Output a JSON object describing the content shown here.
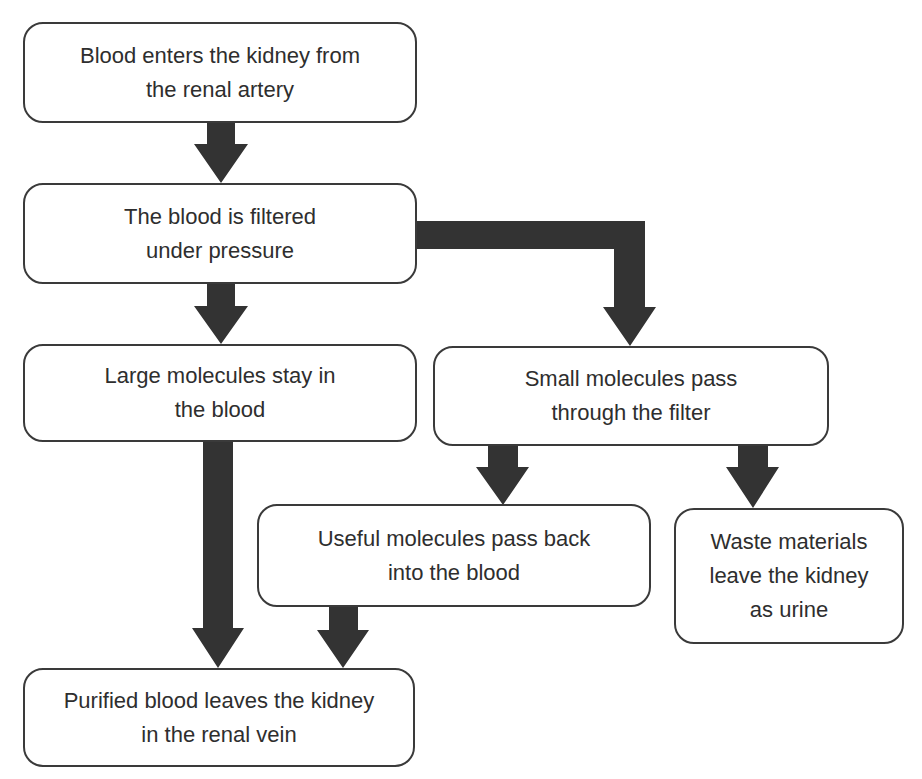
{
  "diagram": {
    "type": "flowchart",
    "arrow_color": "#333333",
    "box_border_color": "#3a3a3a",
    "nodes": [
      {
        "id": "n1",
        "label": "Blood enters the kidney from\nthe renal artery"
      },
      {
        "id": "n2",
        "label": "The blood is filtered\nunder pressure"
      },
      {
        "id": "n3",
        "label": "Large molecules stay in\nthe blood"
      },
      {
        "id": "n4",
        "label": "Small molecules pass\nthrough the filter"
      },
      {
        "id": "n5",
        "label": "Useful molecules pass back\ninto the blood"
      },
      {
        "id": "n6",
        "label": "Waste materials\nleave the kidney\nas urine"
      },
      {
        "id": "n7",
        "label": "Purified blood leaves the kidney\nin the renal vein"
      }
    ],
    "edges": [
      {
        "from": "n1",
        "to": "n2"
      },
      {
        "from": "n2",
        "to": "n3"
      },
      {
        "from": "n2",
        "to": "n4"
      },
      {
        "from": "n4",
        "to": "n5"
      },
      {
        "from": "n4",
        "to": "n6"
      },
      {
        "from": "n3",
        "to": "n7"
      },
      {
        "from": "n5",
        "to": "n7"
      }
    ]
  }
}
